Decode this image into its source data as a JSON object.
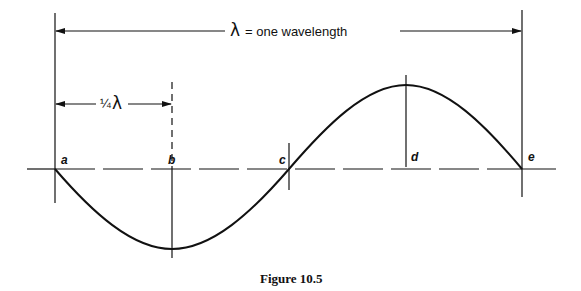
{
  "figure": {
    "caption": "Figure 10.5",
    "wavelength_label": {
      "symbol": "λ",
      "text": "= one wavelength"
    },
    "quarter_label": {
      "fraction": "¼",
      "symbol": "λ"
    },
    "points": [
      {
        "id": "a",
        "label": "a",
        "description": "start, zero crossing"
      },
      {
        "id": "b",
        "label": "b",
        "description": "trough, ¼ wavelength"
      },
      {
        "id": "c",
        "label": "c",
        "description": "zero crossing, ½ wavelength"
      },
      {
        "id": "d",
        "label": "d",
        "description": "crest, ¾ wavelength"
      },
      {
        "id": "e",
        "label": "e",
        "description": "end, one full wavelength"
      }
    ]
  },
  "colors": {
    "line": "#111111",
    "background": "#ffffff"
  }
}
